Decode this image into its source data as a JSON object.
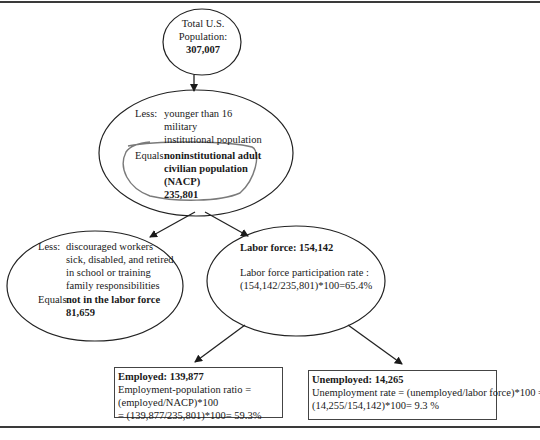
{
  "diagram": {
    "total_population": {
      "line1": "Total U.S.",
      "line2": "Population:",
      "value": "307,007"
    },
    "nacp_node": {
      "less_label": "Less:",
      "less_items": [
        "younger than 16",
        "military",
        "institutional population"
      ],
      "equals_label": "Equals:",
      "equals_lines": [
        "noninstitutional adult",
        "civilian population",
        "(NACP)",
        "235,801"
      ],
      "highlight_color": "#777777"
    },
    "not_in_labor_force_node": {
      "less_label": "Less:",
      "less_items": [
        "discouraged workers",
        "sick, disabled, and retired",
        "in school or training",
        "family responsibilities"
      ],
      "equals_label": "Equals:",
      "equals_text": "not in the labor force",
      "value": "81,659"
    },
    "labor_force_node": {
      "title_label": "Labor force",
      "title_value": ": 154,142",
      "rate_label": "Labor force participation rate :",
      "rate_formula": "(154,142/235,801)*100=65.4%"
    },
    "employed_box": {
      "title": "Employed: 139,877",
      "line1": "Employment-population ratio =",
      "line2": "(employed/NACP)*100",
      "line3": "= (139,877/235,801)*100= 59.3%"
    },
    "unemployed_box": {
      "title": "Unemployed: 14,265",
      "line1": "Unemployment rate = (unemployed/labor force)*100 =",
      "line2": "(14,255/154,142)*100= 9.3 %"
    }
  }
}
